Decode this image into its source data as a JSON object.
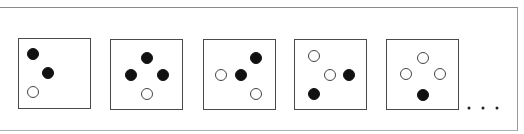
{
  "figure": {
    "colors": {
      "filled": "#111111",
      "hollow_stroke": "#444444",
      "box_border": "#4a4a4a",
      "frame": "#8a8a8a"
    },
    "boxes": [
      {
        "id": 1,
        "left": 18,
        "top": 38,
        "circles": [
          {
            "fill": "black",
            "x": 14,
            "y": 15
          },
          {
            "fill": "black",
            "x": 29,
            "y": 34
          },
          {
            "fill": "white",
            "x": 14,
            "y": 53
          }
        ]
      },
      {
        "id": 2,
        "left": 110,
        "top": 39,
        "circles": [
          {
            "fill": "black",
            "x": 36,
            "y": 18
          },
          {
            "fill": "black",
            "x": 20,
            "y": 35
          },
          {
            "fill": "black",
            "x": 52,
            "y": 35
          },
          {
            "fill": "white",
            "x": 36,
            "y": 54
          }
        ]
      },
      {
        "id": 3,
        "left": 203,
        "top": 39,
        "circles": [
          {
            "fill": "black",
            "x": 52,
            "y": 18
          },
          {
            "fill": "white",
            "x": 17,
            "y": 35
          },
          {
            "fill": "black",
            "x": 37,
            "y": 35
          },
          {
            "fill": "white",
            "x": 52,
            "y": 54
          }
        ]
      },
      {
        "id": 4,
        "left": 294,
        "top": 39,
        "circles": [
          {
            "fill": "white",
            "x": 19,
            "y": 16
          },
          {
            "fill": "white",
            "x": 35,
            "y": 35
          },
          {
            "fill": "black",
            "x": 54,
            "y": 35
          },
          {
            "fill": "black",
            "x": 19,
            "y": 54
          }
        ]
      },
      {
        "id": 5,
        "left": 386,
        "top": 39,
        "circles": [
          {
            "fill": "white",
            "x": 36,
            "y": 18
          },
          {
            "fill": "white",
            "x": 19,
            "y": 34
          },
          {
            "fill": "white",
            "x": 53,
            "y": 34
          },
          {
            "fill": "black",
            "x": 36,
            "y": 55
          }
        ]
      }
    ],
    "continuation": {
      "symbol": "...",
      "dots_x": [
        469,
        483,
        497
      ],
      "dots_y": 108
    }
  }
}
